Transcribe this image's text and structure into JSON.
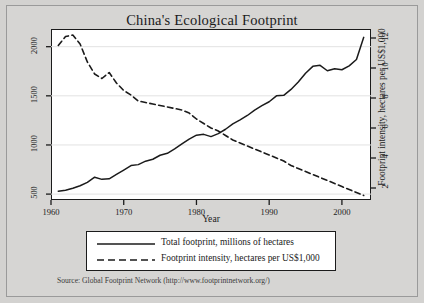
{
  "figure": {
    "title": "China's Ecological Footprint",
    "source_note": "Source: Global Footprint Network (http://www.footprintnetwork.org/)"
  },
  "legend": {
    "items": [
      {
        "label": "Total footprint, millions of hectares",
        "style": "solid",
        "swatch": "legend-line-solid"
      },
      {
        "label": "Footprint intensity, hectares per US$1,000",
        "style": "dashed",
        "swatch": "legend-line-dashed"
      }
    ]
  },
  "axes": {
    "x_label": "Year",
    "x_ticks": [
      "1960",
      "1970",
      "1980",
      "1990",
      "2000"
    ],
    "y_left_label": "Total footprint, millions of hectares",
    "y_left_ticks": [
      "500",
      "1000",
      "1500",
      "2000"
    ],
    "y_right_label": "Footprint intensity, hectares per US$1,000",
    "y_right_ticks": [
      "2",
      "4",
      "6",
      "8",
      "10",
      "12"
    ]
  },
  "colors": {
    "line": "#1b1b1b",
    "grid": "#e2e2e2",
    "plot_bg": "#ffffff",
    "figure_bg": "#d3d2d0"
  },
  "chart_data": {
    "type": "line",
    "title": "China's Ecological Footprint",
    "xlabel": "Year",
    "ylabel": "Total footprint, millions of hectares",
    "ylabel2": "Footprint intensity, hectares per US$1,000",
    "xlim": [
      1960,
      2004
    ],
    "ylim": [
      440,
      2180
    ],
    "ylim2": [
      1.2,
      12.6
    ],
    "grid": true,
    "legend_position": "below-plot",
    "x": [
      1961,
      1962,
      1963,
      1964,
      1965,
      1966,
      1967,
      1968,
      1969,
      1970,
      1971,
      1972,
      1973,
      1974,
      1975,
      1976,
      1977,
      1978,
      1979,
      1980,
      1981,
      1982,
      1983,
      1984,
      1985,
      1986,
      1987,
      1988,
      1989,
      1990,
      1991,
      1992,
      1993,
      1994,
      1995,
      1996,
      1997,
      1998,
      1999,
      2000,
      2001,
      2002,
      2003
    ],
    "series": [
      {
        "name": "Total footprint, millions of hectares",
        "axis": "left",
        "style": "solid",
        "units": "millions of hectares",
        "values": [
          530,
          540,
          560,
          585,
          620,
          672,
          650,
          655,
          700,
          745,
          790,
          800,
          835,
          855,
          895,
          915,
          960,
          1010,
          1060,
          1100,
          1108,
          1085,
          1115,
          1160,
          1215,
          1255,
          1300,
          1355,
          1400,
          1440,
          1500,
          1505,
          1565,
          1640,
          1730,
          1800,
          1810,
          1755,
          1775,
          1765,
          1805,
          1870,
          2095
        ]
      },
      {
        "name": "Footprint intensity, hectares per US$1,000",
        "axis": "right",
        "style": "dashed",
        "units": "hectares per US$1,000",
        "values": [
          11.5,
          12.1,
          12.2,
          11.6,
          10.4,
          9.6,
          9.3,
          9.7,
          9.0,
          8.5,
          8.2,
          7.8,
          7.7,
          7.6,
          7.5,
          7.4,
          7.3,
          7.2,
          7.0,
          6.6,
          6.3,
          6.0,
          5.8,
          5.5,
          5.2,
          5.0,
          4.8,
          4.6,
          4.4,
          4.2,
          4.0,
          3.8,
          3.5,
          3.3,
          3.1,
          2.9,
          2.7,
          2.5,
          2.3,
          2.1,
          1.9,
          1.7,
          1.5
        ]
      }
    ]
  }
}
